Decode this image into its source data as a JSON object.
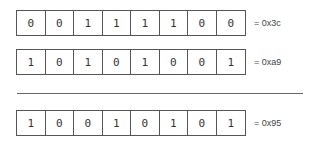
{
  "rows": [
    {
      "bits": [
        "0",
        "0",
        "1",
        "1",
        "1",
        "1",
        "0",
        "0"
      ],
      "label": "= 0x3c"
    },
    {
      "bits": [
        "1",
        "0",
        "1",
        "0",
        "1",
        "0",
        "0",
        "1"
      ],
      "label": "= 0xa9"
    },
    {
      "bits": [
        "1",
        "0",
        "0",
        "1",
        "0",
        "1",
        "0",
        "1"
      ],
      "label": "= 0x95"
    }
  ]
}
